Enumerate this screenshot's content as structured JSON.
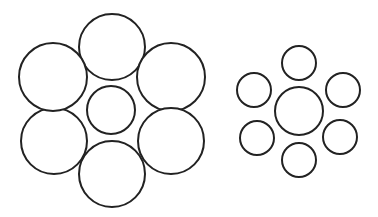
{
  "figure": {
    "title": "",
    "stroke_color": "#222222",
    "stroke_width": 2,
    "fill_color": "#ffffff"
  },
  "clusters": [
    {
      "name": "large-surround-cluster",
      "center": {
        "cx": 111,
        "cy": 110,
        "r": 24
      },
      "surround": [
        {
          "cx": 112,
          "cy": 47,
          "r": 33
        },
        {
          "cx": 171,
          "cy": 77,
          "r": 34
        },
        {
          "cx": 171,
          "cy": 141,
          "r": 33
        },
        {
          "cx": 112,
          "cy": 174,
          "r": 33
        },
        {
          "cx": 54,
          "cy": 141,
          "r": 33
        },
        {
          "cx": 53,
          "cy": 77,
          "r": 34
        }
      ]
    },
    {
      "name": "small-surround-cluster",
      "center": {
        "cx": 299,
        "cy": 111,
        "r": 24
      },
      "surround": [
        {
          "cx": 299,
          "cy": 63,
          "r": 17
        },
        {
          "cx": 343,
          "cy": 90,
          "r": 17
        },
        {
          "cx": 340,
          "cy": 137,
          "r": 17
        },
        {
          "cx": 299,
          "cy": 160,
          "r": 17
        },
        {
          "cx": 257,
          "cy": 138,
          "r": 17
        },
        {
          "cx": 254,
          "cy": 90,
          "r": 17
        }
      ]
    }
  ]
}
